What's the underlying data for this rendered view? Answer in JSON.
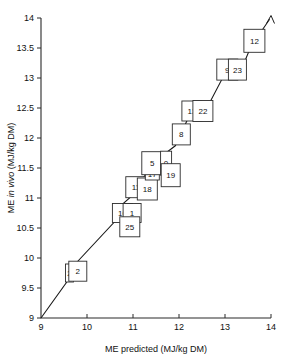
{
  "chart_data": {
    "type": "scatter",
    "title": "",
    "xlabel": "ME predicted (MJ/kg DM)",
    "ylabel_prefix": "ME ",
    "ylabel_italic": "in vivo",
    "ylabel_suffix": " (MJ/kg DM)",
    "xlim": [
      9,
      14
    ],
    "ylim": [
      9,
      14
    ],
    "xticks": [
      "9",
      "10",
      "11",
      "12",
      "13",
      "14"
    ],
    "xtick_values": [
      9,
      10,
      11,
      12,
      13,
      14
    ],
    "yticks": [
      "9",
      "9.5",
      "10",
      "10.5",
      "11",
      "11.5",
      "12",
      "12.5",
      "13",
      "13.5",
      "14"
    ],
    "ytick_values": [
      9,
      9.5,
      10,
      10.5,
      11,
      11.5,
      12,
      12.5,
      13,
      13.5,
      14
    ],
    "grid": false,
    "legend": "none",
    "line_style": "identity-line-with-arrowhead",
    "marker_style": "numbered-open-square",
    "points": [
      {
        "label": "2",
        "x": 9.62,
        "y": 9.75,
        "w": 8,
        "h": 18
      },
      {
        "label": "2",
        "x": 9.8,
        "y": 9.78,
        "w": 18,
        "h": 20
      },
      {
        "label": "16",
        "x": 10.77,
        "y": 10.75,
        "w": 20,
        "h": 19
      },
      {
        "label": "1",
        "x": 10.98,
        "y": 10.75,
        "w": 18,
        "h": 19
      },
      {
        "label": "25",
        "x": 10.93,
        "y": 10.52,
        "w": 20,
        "h": 20
      },
      {
        "label": "11",
        "x": 11.06,
        "y": 11.18,
        "w": 20,
        "h": 21
      },
      {
        "label": "18",
        "x": 11.31,
        "y": 11.15,
        "w": 20,
        "h": 22
      },
      {
        "label": "17",
        "x": 11.42,
        "y": 11.4,
        "w": 14,
        "h": 12
      },
      {
        "label": "5",
        "x": 11.42,
        "y": 11.58,
        "w": 21,
        "h": 23
      },
      {
        "label": "0",
        "x": 11.72,
        "y": 11.58,
        "w": 11,
        "h": 24
      },
      {
        "label": "19",
        "x": 11.82,
        "y": 11.38,
        "w": 19,
        "h": 23
      },
      {
        "label": "8",
        "x": 12.05,
        "y": 12.06,
        "w": 18,
        "h": 21
      },
      {
        "label": "13",
        "x": 12.28,
        "y": 12.45,
        "w": 20,
        "h": 20
      },
      {
        "label": "22",
        "x": 12.52,
        "y": 12.45,
        "w": 20,
        "h": 21
      },
      {
        "label": "9",
        "x": 13.05,
        "y": 13.14,
        "w": 21,
        "h": 21
      },
      {
        "label": "23",
        "x": 13.27,
        "y": 13.14,
        "w": 18,
        "h": 21
      },
      {
        "label": "12",
        "x": 13.64,
        "y": 13.62,
        "w": 21,
        "h": 23
      }
    ],
    "line_path": [
      {
        "x": 9.0,
        "y": 9.0
      },
      {
        "x": 9.58,
        "y": 9.62
      },
      {
        "x": 9.72,
        "y": 9.88
      },
      {
        "x": 10.62,
        "y": 10.62
      },
      {
        "x": 10.72,
        "y": 10.86
      },
      {
        "x": 10.95,
        "y": 11.02
      },
      {
        "x": 11.18,
        "y": 11.3
      },
      {
        "x": 11.35,
        "y": 11.46
      },
      {
        "x": 11.6,
        "y": 11.48
      },
      {
        "x": 11.66,
        "y": 11.72
      },
      {
        "x": 11.92,
        "y": 11.87
      },
      {
        "x": 12.18,
        "y": 12.3
      },
      {
        "x": 12.4,
        "y": 12.36
      },
      {
        "x": 12.66,
        "y": 12.58
      },
      {
        "x": 12.96,
        "y": 13.02
      },
      {
        "x": 13.42,
        "y": 13.26
      },
      {
        "x": 13.56,
        "y": 13.52
      },
      {
        "x": 13.97,
        "y": 13.98
      }
    ]
  }
}
